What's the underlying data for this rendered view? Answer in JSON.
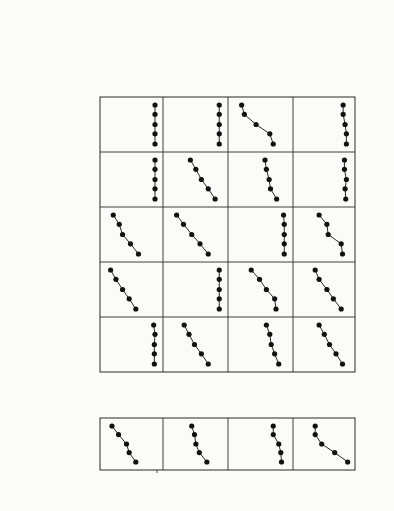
{
  "chart_data": {
    "type": "line",
    "layout": "small-multiples grid (figure rotated 90° clockwise)",
    "xlabel": "Effector / Target Ratio",
    "ylabel": "% Specific Lysis",
    "x": [
      0.3,
      1,
      3,
      10,
      30
    ],
    "x_tick_labels": [
      "0.3",
      "1",
      "3",
      "10",
      "30"
    ],
    "ylim": [
      0,
      80
    ],
    "y_ticks": [
      0,
      20,
      40,
      60,
      80
    ],
    "header_targets": "Targets",
    "header_clones": "CTL clones",
    "targets": [
      {
        "key": "MEL",
        "label": "LB33-MEL.A"
      },
      {
        "key": "A",
        "label": "A⁻"
      },
      {
        "key": "B",
        "label": "B⁻"
      },
      {
        "key": "C",
        "label": "C⁻"
      },
      {
        "key": "AD",
        "label": "A⁻D⁻"
      },
      {
        "key": "ABD",
        "label": "A⁻B⁻D⁻"
      }
    ],
    "selection_steps": [
      {
        "label": "isc with anti-A",
        "to": "A"
      },
      {
        "label": "isc with anti-B",
        "to": "B"
      },
      {
        "label": "isc with anti-C",
        "to": "C"
      },
      {
        "label": "isc with anti-D",
        "to": "AD"
      },
      {
        "label": "isc with anti-B",
        "to": "ABD"
      }
    ],
    "clones": [
      {
        "name": "LB33-CTL-159/3",
        "specificity": "anti-A",
        "series": {
          "MEL": [
            32,
            42,
            46,
            58,
            68
          ],
          "A": [
            4,
            4,
            4,
            3,
            5
          ],
          "B": [
            32,
            42,
            52,
            62,
            70
          ],
          "C": [
            28,
            40,
            52,
            57,
            66
          ],
          "AD": [
            3,
            3,
            3,
            3,
            3
          ],
          "ABD": [
            3,
            3,
            3,
            3,
            3
          ]
        }
      },
      {
        "name": "LB33-CTL-159/5",
        "specificity": "anti-B",
        "series": {
          "MEL": [
            22,
            33,
            38,
            40,
            44
          ],
          "A": [
            20,
            30,
            40,
            48,
            55
          ],
          "B": [
            4,
            4,
            4,
            4,
            4
          ],
          "C": [
            20,
            32,
            44,
            56,
            66
          ],
          "AD": [
            10,
            20,
            30,
            38,
            46
          ],
          "ABD": [
            4,
            4,
            4,
            4,
            4
          ]
        }
      },
      {
        "name": "LB33-CTL-204/26",
        "specificity": "anti-C",
        "series": {
          "MEL": [
            8,
            9,
            12,
            20,
            20
          ],
          "A": [
            12,
            18,
            23,
            25,
            30
          ],
          "B": [
            16,
            18,
            30,
            40,
            52
          ],
          "C": [
            4,
            4,
            4,
            4,
            5
          ],
          "AD": [
            15,
            24,
            26,
            30,
            32
          ],
          "ABD": [
            20,
            25,
            45,
            62,
            66
          ]
        }
      },
      {
        "name": "LB33-CTL-202/1",
        "specificity": "anti-D",
        "series": {
          "MEL": [
            2,
            22,
            42,
            52,
            52
          ],
          "A": [
            10,
            20,
            30,
            38,
            46
          ],
          "B": [
            12,
            24,
            34,
            46,
            52
          ],
          "C": [
            10,
            12,
            32,
            34,
            46
          ],
          "AD": [
            5,
            6,
            4,
            7,
            7
          ],
          "ABD": [
            4,
            4,
            6,
            9,
            9
          ]
        }
      }
    ]
  }
}
